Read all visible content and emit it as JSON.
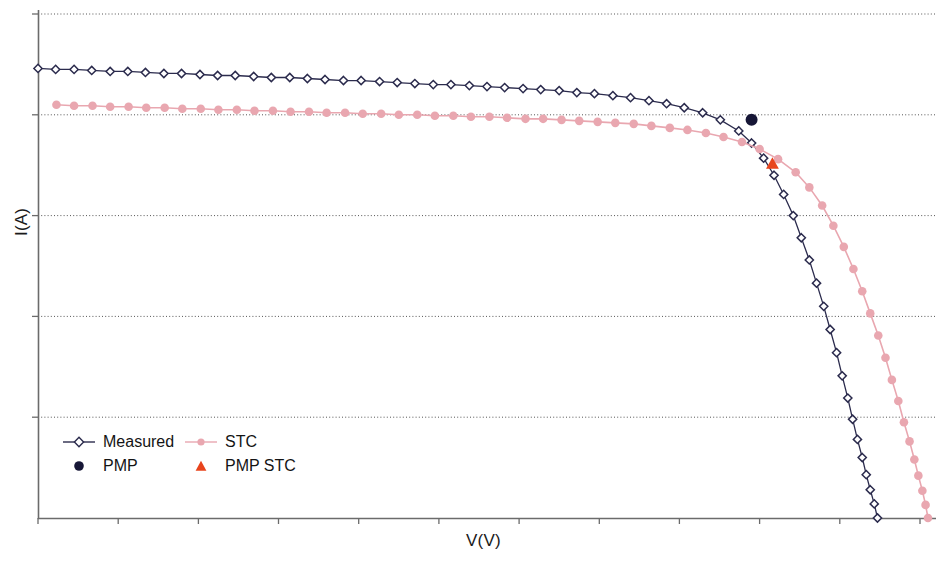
{
  "chart_data": {
    "type": "line",
    "title": "",
    "xlabel": "V(V)",
    "ylabel": "I(A)",
    "grid": "horizontal-dotted",
    "legend_position": "inside-bottom-left",
    "axis_tick_labels": "none",
    "xlim": [
      0,
      11.2
    ],
    "ylim": [
      0,
      5.0
    ],
    "x_ticks": [
      0,
      1,
      2,
      3,
      4,
      5,
      6,
      7,
      8,
      9,
      10,
      11
    ],
    "y_gridlines": [
      1.0,
      2.0,
      3.0,
      4.0,
      5.0
    ],
    "colors": {
      "measured": "#2b2b4d",
      "stc": "#e9a7b0",
      "pmp": "#161636",
      "pmp_stc": "#e8441c",
      "grid": "#555555",
      "axis": "#6b6b6b",
      "background": "#ffffff"
    },
    "series": [
      {
        "name": "Measured",
        "marker": "open-diamond",
        "color": "#2b2b4d",
        "x": [
          0.0,
          0.22,
          0.45,
          0.67,
          0.9,
          1.12,
          1.34,
          1.57,
          1.79,
          2.02,
          2.24,
          2.46,
          2.69,
          2.91,
          3.14,
          3.36,
          3.58,
          3.81,
          4.03,
          4.26,
          4.48,
          4.7,
          4.93,
          5.15,
          5.38,
          5.6,
          5.82,
          6.05,
          6.27,
          6.5,
          6.72,
          6.94,
          7.17,
          7.39,
          7.62,
          7.84,
          8.06,
          8.29,
          8.51,
          8.74,
          8.9,
          9.05,
          9.18,
          9.3,
          9.42,
          9.52,
          9.62,
          9.71,
          9.8,
          9.88,
          9.96,
          10.03,
          10.1,
          10.16,
          10.22,
          10.28,
          10.33,
          10.38,
          10.43,
          10.47
        ],
        "y": [
          4.46,
          4.45,
          4.45,
          4.44,
          4.43,
          4.43,
          4.42,
          4.41,
          4.41,
          4.4,
          4.39,
          4.39,
          4.38,
          4.37,
          4.37,
          4.36,
          4.35,
          4.34,
          4.34,
          4.33,
          4.32,
          4.31,
          4.3,
          4.3,
          4.29,
          4.28,
          4.27,
          4.26,
          4.25,
          4.24,
          4.22,
          4.21,
          4.19,
          4.17,
          4.14,
          4.11,
          4.07,
          4.02,
          3.95,
          3.84,
          3.72,
          3.57,
          3.4,
          3.21,
          3.0,
          2.78,
          2.56,
          2.33,
          2.1,
          1.87,
          1.64,
          1.41,
          1.19,
          0.98,
          0.78,
          0.6,
          0.43,
          0.28,
          0.14,
          0.0
        ]
      },
      {
        "name": "STC",
        "marker": "filled-circle",
        "color": "#e9a7b0",
        "x": [
          0.23,
          0.45,
          0.68,
          0.9,
          1.13,
          1.35,
          1.58,
          1.8,
          2.03,
          2.25,
          2.48,
          2.7,
          2.93,
          3.15,
          3.38,
          3.6,
          3.83,
          4.05,
          4.28,
          4.5,
          4.73,
          4.95,
          5.18,
          5.4,
          5.63,
          5.85,
          6.08,
          6.3,
          6.53,
          6.75,
          6.98,
          7.2,
          7.43,
          7.65,
          7.88,
          8.1,
          8.33,
          8.55,
          8.78,
          9.0,
          9.23,
          9.45,
          9.62,
          9.78,
          9.92,
          10.05,
          10.17,
          10.28,
          10.38,
          10.48,
          10.57,
          10.65,
          10.73,
          10.8,
          10.87,
          10.93,
          10.98,
          11.03,
          11.07,
          11.1
        ],
        "y": [
          4.1,
          4.09,
          4.09,
          4.08,
          4.08,
          4.07,
          4.07,
          4.06,
          4.06,
          4.05,
          4.05,
          4.04,
          4.04,
          4.03,
          4.03,
          4.02,
          4.02,
          4.01,
          4.01,
          4.0,
          4.0,
          3.99,
          3.99,
          3.98,
          3.98,
          3.97,
          3.96,
          3.96,
          3.95,
          3.94,
          3.93,
          3.92,
          3.91,
          3.89,
          3.87,
          3.85,
          3.82,
          3.78,
          3.73,
          3.66,
          3.56,
          3.43,
          3.28,
          3.1,
          2.9,
          2.69,
          2.47,
          2.25,
          2.03,
          1.81,
          1.59,
          1.37,
          1.16,
          0.95,
          0.76,
          0.58,
          0.42,
          0.27,
          0.13,
          0.0
        ]
      }
    ],
    "points": [
      {
        "name": "PMP",
        "marker": "filled-circle",
        "color": "#161636",
        "x": 8.9,
        "y": 3.95
      },
      {
        "name": "PMP STC",
        "marker": "filled-triangle",
        "color": "#e8441c",
        "x": 9.16,
        "y": 3.52
      }
    ]
  },
  "legend": {
    "rows": [
      [
        {
          "label": "Measured",
          "marker": "line-open-diamond"
        },
        {
          "label": "STC",
          "marker": "line-filled-circle"
        }
      ],
      [
        {
          "label": "PMP",
          "marker": "filled-circle"
        },
        {
          "label": "PMP STC",
          "marker": "filled-triangle"
        }
      ]
    ]
  },
  "axes": {
    "x_title": "V(V)",
    "y_title": "I(A)"
  }
}
